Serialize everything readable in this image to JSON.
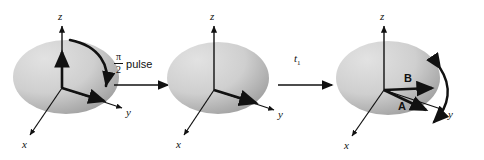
{
  "figure": {
    "background_color": "#ffffff",
    "ink_color": "#111111",
    "ellipse_light": "#d9d9d9",
    "ellipse_dark": "#9a9a9a"
  },
  "panels": [
    {
      "id": "panel-1",
      "axes": {
        "x": "x",
        "y": "y",
        "z": "z"
      },
      "vectors": [
        {
          "name": "magnetization-z",
          "label": ""
        },
        {
          "name": "magnetization-y",
          "label": ""
        }
      ],
      "rotation_arrow": "curved-arrow-z-to-y"
    },
    {
      "id": "panel-2",
      "axes": {
        "x": "x",
        "y": "y",
        "z": "z"
      },
      "vectors": [
        {
          "name": "magnetization-y",
          "label": ""
        }
      ],
      "rotation_arrow": ""
    },
    {
      "id": "panel-3",
      "axes": {
        "x": "x",
        "y": "y",
        "z": "z"
      },
      "vectors": [
        {
          "name": "magnetization-b",
          "label": "B"
        },
        {
          "name": "magnetization-a",
          "label": "A"
        }
      ],
      "rotation_arrow": "curved-double-arrow-precession"
    }
  ],
  "transitions": [
    {
      "id": "transition-1",
      "numerator": "π",
      "denominator": "2",
      "text": "pulse"
    },
    {
      "id": "transition-2",
      "symbol": "t",
      "subscript": "1"
    }
  ]
}
